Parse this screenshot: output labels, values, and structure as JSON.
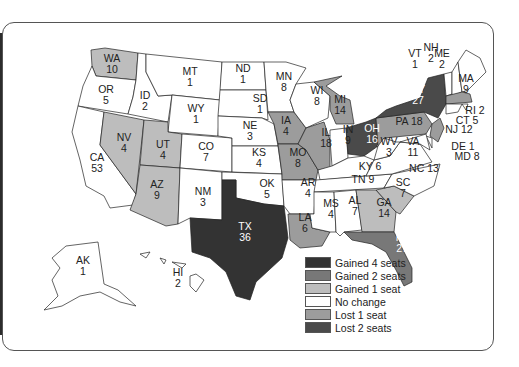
{
  "colors": {
    "gained4": "#333333",
    "gained2": "#787878",
    "gained1": "#bdbdbd",
    "nochange": "#ffffff",
    "lost1": "#9c9c9c",
    "lost2": "#4a4a4a"
  },
  "legend": [
    {
      "key": "gained4",
      "label": "Gained 4 seats",
      "color": "#333333"
    },
    {
      "key": "gained2",
      "label": "Gained 2 seats",
      "color": "#787878"
    },
    {
      "key": "gained1",
      "label": "Gained 1 seat",
      "color": "#bdbdbd"
    },
    {
      "key": "nochange",
      "label": "No change",
      "color": "#ffffff"
    },
    {
      "key": "lost1",
      "label": "Lost 1 seat",
      "color": "#9c9c9c"
    },
    {
      "key": "lost2",
      "label": "Lost 2 seats",
      "color": "#4a4a4a"
    }
  ],
  "states": {
    "WA": {
      "abbr": "WA",
      "seats": "10",
      "change": "gained1"
    },
    "OR": {
      "abbr": "OR",
      "seats": "5",
      "change": "nochange"
    },
    "CA": {
      "abbr": "CA",
      "seats": "53",
      "change": "nochange"
    },
    "ID": {
      "abbr": "ID",
      "seats": "2",
      "change": "nochange"
    },
    "NV": {
      "abbr": "NV",
      "seats": "4",
      "change": "gained1"
    },
    "MT": {
      "abbr": "MT",
      "seats": "1",
      "change": "nochange"
    },
    "WY": {
      "abbr": "WY",
      "seats": "1",
      "change": "nochange"
    },
    "UT": {
      "abbr": "UT",
      "seats": "4",
      "change": "gained1"
    },
    "AZ": {
      "abbr": "AZ",
      "seats": "9",
      "change": "gained1"
    },
    "CO": {
      "abbr": "CO",
      "seats": "7",
      "change": "nochange"
    },
    "NM": {
      "abbr": "NM",
      "seats": "3",
      "change": "nochange"
    },
    "ND": {
      "abbr": "ND",
      "seats": "1",
      "change": "nochange"
    },
    "SD": {
      "abbr": "SD",
      "seats": "1",
      "change": "nochange"
    },
    "NE": {
      "abbr": "NE",
      "seats": "3",
      "change": "nochange"
    },
    "KS": {
      "abbr": "KS",
      "seats": "4",
      "change": "nochange"
    },
    "OK": {
      "abbr": "OK",
      "seats": "5",
      "change": "nochange"
    },
    "TX": {
      "abbr": "TX",
      "seats": "36",
      "change": "gained4"
    },
    "MN": {
      "abbr": "MN",
      "seats": "8",
      "change": "nochange"
    },
    "IA": {
      "abbr": "IA",
      "seats": "4",
      "change": "lost1"
    },
    "MO": {
      "abbr": "MO",
      "seats": "8",
      "change": "lost1"
    },
    "AR": {
      "abbr": "AR",
      "seats": "4",
      "change": "nochange"
    },
    "LA": {
      "abbr": "LA",
      "seats": "6",
      "change": "lost1"
    },
    "WI": {
      "abbr": "WI",
      "seats": "8",
      "change": "nochange"
    },
    "IL": {
      "abbr": "IL",
      "seats": "18",
      "change": "lost1"
    },
    "MI": {
      "abbr": "MI",
      "seats": "14",
      "change": "lost1"
    },
    "IN": {
      "abbr": "IN",
      "seats": "9",
      "change": "nochange"
    },
    "OH": {
      "abbr": "OH",
      "seats": "16",
      "change": "lost2"
    },
    "KY": {
      "abbr": "KY",
      "seats": "6",
      "change": "nochange"
    },
    "TN": {
      "abbr": "TN",
      "seats": "9",
      "change": "nochange"
    },
    "MS": {
      "abbr": "MS",
      "seats": "4",
      "change": "nochange"
    },
    "AL": {
      "abbr": "AL",
      "seats": "7",
      "change": "nochange"
    },
    "GA": {
      "abbr": "GA",
      "seats": "14",
      "change": "gained1"
    },
    "FL": {
      "abbr": "FL",
      "seats": "27",
      "change": "gained2"
    },
    "SC": {
      "abbr": "SC",
      "seats": "7",
      "change": "gained1"
    },
    "NC": {
      "abbr": "NC",
      "seats": "13",
      "change": "nochange"
    },
    "VA": {
      "abbr": "VA",
      "seats": "11",
      "change": "nochange"
    },
    "WV": {
      "abbr": "WV",
      "seats": "3",
      "change": "nochange"
    },
    "PA": {
      "abbr": "PA",
      "seats": "18",
      "change": "lost1"
    },
    "NY": {
      "abbr": "NY",
      "seats": "27",
      "change": "lost2"
    },
    "VT": {
      "abbr": "VT",
      "seats": "1",
      "change": "nochange"
    },
    "NH": {
      "abbr": "NH",
      "seats": "2",
      "change": "nochange"
    },
    "ME": {
      "abbr": "ME",
      "seats": "2",
      "change": "nochange"
    },
    "MA": {
      "abbr": "MA",
      "seats": "9",
      "change": "lost1"
    },
    "RI": {
      "abbr": "RI",
      "seats": "2",
      "change": "nochange"
    },
    "CT": {
      "abbr": "CT",
      "seats": "5",
      "change": "nochange"
    },
    "NJ": {
      "abbr": "NJ",
      "seats": "12",
      "change": "lost1"
    },
    "DE": {
      "abbr": "DE",
      "seats": "1",
      "change": "nochange"
    },
    "MD": {
      "abbr": "MD",
      "seats": "8",
      "change": "nochange"
    },
    "AK": {
      "abbr": "AK",
      "seats": "1",
      "change": "nochange"
    },
    "HI": {
      "abbr": "HI",
      "seats": "2",
      "change": "nochange"
    }
  },
  "callouts": {
    "RI": "RI 2",
    "CT": "CT 5",
    "NJ": "NJ 12",
    "DE": "DE 1",
    "MD": "MD 8",
    "PA": "PA 18",
    "KY": "KY 6",
    "TN": "TN 9",
    "NC": "NC 13"
  }
}
